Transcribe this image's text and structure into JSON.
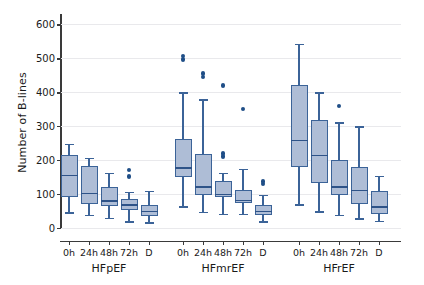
{
  "chart_data": {
    "type": "box",
    "title": "",
    "xlabel": "",
    "ylabel": "Number of B-lines",
    "ylim": [
      0,
      630
    ],
    "yticks": [
      0,
      100,
      200,
      300,
      400,
      500,
      600
    ],
    "ytick_labels": [
      "0",
      "100",
      "200",
      "300",
      "400",
      "500",
      "600"
    ],
    "grid": "horizontal",
    "legend": "none",
    "timepoints": [
      "0h",
      "24h",
      "48h",
      "72h",
      "D"
    ],
    "groups": [
      {
        "name": "HFpEF",
        "boxes": [
          {
            "timepoint": "0h",
            "whisker_low": 46,
            "q1": 92,
            "median": 155,
            "q3": 216,
            "whisker_high": 247,
            "outliers": []
          },
          {
            "timepoint": "24h",
            "whisker_low": 39,
            "q1": 70,
            "median": 101,
            "q3": 182,
            "whisker_high": 207,
            "outliers": []
          },
          {
            "timepoint": "48h",
            "whisker_low": 30,
            "q1": 66,
            "median": 79,
            "q3": 122,
            "whisker_high": 162,
            "outliers": []
          },
          {
            "timepoint": "72h",
            "whisker_low": 20,
            "q1": 52,
            "median": 68,
            "q3": 85,
            "whisker_high": 107,
            "outliers": [
              152,
              171
            ]
          },
          {
            "timepoint": "D",
            "whisker_low": 17,
            "q1": 35,
            "median": 49,
            "q3": 68,
            "whisker_high": 110,
            "outliers": []
          }
        ]
      },
      {
        "name": "HFmrEF",
        "boxes": [
          {
            "timepoint": "0h",
            "whisker_low": 64,
            "q1": 150,
            "median": 176,
            "q3": 261,
            "whisker_high": 400,
            "outliers": [
              496,
              506
            ]
          },
          {
            "timepoint": "24h",
            "whisker_low": 47,
            "q1": 97,
            "median": 120,
            "q3": 219,
            "whisker_high": 379,
            "outliers": [
              444,
              455
            ]
          },
          {
            "timepoint": "48h",
            "whisker_low": 42,
            "q1": 92,
            "median": 99,
            "q3": 138,
            "whisker_high": 163,
            "outliers": [
              211,
              219,
              419
            ]
          },
          {
            "timepoint": "72h",
            "whisker_low": 41,
            "q1": 74,
            "median": 81,
            "q3": 113,
            "whisker_high": 175,
            "outliers": [
              350
            ]
          },
          {
            "timepoint": "D",
            "whisker_low": 20,
            "q1": 38,
            "median": 49,
            "q3": 69,
            "whisker_high": 97,
            "outliers": [
              130,
              137
            ]
          }
        ]
      },
      {
        "name": "HFrEF",
        "boxes": [
          {
            "timepoint": "0h",
            "whisker_low": 70,
            "q1": 180,
            "median": 258,
            "q3": 420,
            "whisker_high": 542,
            "outliers": []
          },
          {
            "timepoint": "24h",
            "whisker_low": 49,
            "q1": 131,
            "median": 214,
            "q3": 318,
            "whisker_high": 400,
            "outliers": []
          },
          {
            "timepoint": "48h",
            "whisker_low": 39,
            "q1": 97,
            "median": 120,
            "q3": 199,
            "whisker_high": 311,
            "outliers": [
              359
            ]
          },
          {
            "timepoint": "72h",
            "whisker_low": 29,
            "q1": 71,
            "median": 110,
            "q3": 180,
            "whisker_high": 299,
            "outliers": []
          },
          {
            "timepoint": "D",
            "whisker_low": 22,
            "q1": 40,
            "median": 62,
            "q3": 109,
            "whisker_high": 153,
            "outliers": []
          }
        ]
      }
    ],
    "colors": {
      "box_fill": "#aebdd6",
      "box_edge": "#3b6398",
      "median": "#2e5388",
      "outlier": "#1f4e87",
      "grid": "#e9e9ec",
      "axis": "#3a3a3a",
      "text": "#1a1a1a",
      "background": "#ffffff"
    }
  }
}
